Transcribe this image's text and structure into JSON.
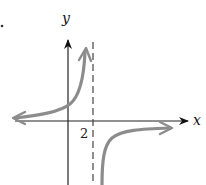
{
  "diagram": {
    "type": "graph-of-rational-function",
    "axes": {
      "x_label": "x",
      "y_label": "y"
    },
    "asymptote": {
      "orientation": "vertical",
      "style": "dashed",
      "x_value_label": "2"
    },
    "branches": [
      {
        "name": "left-branch",
        "description": "approaches y=0 from above as x→-∞, rises to +∞ as x→2⁻"
      },
      {
        "name": "right-branch",
        "description": "rises from -∞ as x→2⁺, approaches y=0 from below as x→+∞"
      }
    ],
    "colors": {
      "axes": "#111111",
      "curve": "#8c8c8c",
      "asymptote": "#444444"
    }
  }
}
